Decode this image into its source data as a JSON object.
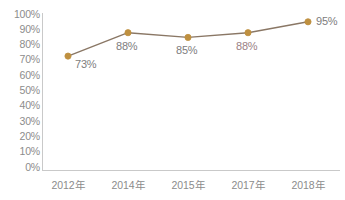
{
  "chart_data": {
    "type": "line",
    "title": "",
    "subtitle": "",
    "xlabel": "",
    "ylabel": "",
    "categories": [
      "2012年",
      "2014年",
      "2015年",
      "2017年",
      "2018年"
    ],
    "values": [
      73,
      88,
      85,
      88,
      95
    ],
    "point_labels": [
      "73%",
      "88%",
      "85%",
      "88%",
      "95%"
    ],
    "ylim": [
      0,
      100
    ],
    "ytick_values": [
      100,
      90,
      80,
      70,
      60,
      50,
      40,
      30,
      20,
      10,
      0
    ],
    "ytick_labels": [
      "100%",
      "90%",
      "80%",
      "70%",
      "60%",
      "50%",
      "40%",
      "30%",
      "20%",
      "10%",
      "0%"
    ],
    "grid": false,
    "legend": false,
    "legend_position": "none",
    "series": [
      {
        "name": "",
        "values": [
          73,
          88,
          85,
          88,
          95
        ]
      }
    ],
    "colors": {
      "line": "#8a7765",
      "marker_fill": "#bf9040",
      "marker_stroke": "#bf9040",
      "axis": "#c9c9c9",
      "tick_text": "#8c8c8c",
      "label_text": "#7d7d7d",
      "label_text_tinted": "#9a7f85",
      "background": "#ffffff"
    }
  }
}
